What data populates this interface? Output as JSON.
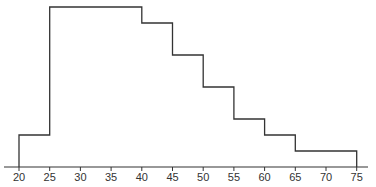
{
  "chart_data": {
    "type": "histogram",
    "title": "",
    "xlabel": "",
    "ylabel": "",
    "bins": [
      {
        "from": 20,
        "to": 25,
        "value": 2
      },
      {
        "from": 25,
        "to": 30,
        "value": 10
      },
      {
        "from": 30,
        "to": 35,
        "value": 10
      },
      {
        "from": 35,
        "to": 40,
        "value": 10
      },
      {
        "from": 40,
        "to": 45,
        "value": 9
      },
      {
        "from": 45,
        "to": 50,
        "value": 7
      },
      {
        "from": 50,
        "to": 55,
        "value": 5
      },
      {
        "from": 55,
        "to": 60,
        "value": 3
      },
      {
        "from": 60,
        "to": 65,
        "value": 2
      },
      {
        "from": 65,
        "to": 70,
        "value": 1
      },
      {
        "from": 70,
        "to": 75,
        "value": 1
      }
    ],
    "x_ticks": [
      "20",
      "25",
      "30",
      "35",
      "40",
      "45",
      "50",
      "55",
      "60",
      "65",
      "70",
      "75"
    ],
    "xlim": [
      20,
      75
    ],
    "ylim": [
      0,
      10
    ],
    "y_axis_visible": false,
    "grid": false,
    "legend": null,
    "style": {
      "line_color": "#333333",
      "fill": "none"
    }
  }
}
